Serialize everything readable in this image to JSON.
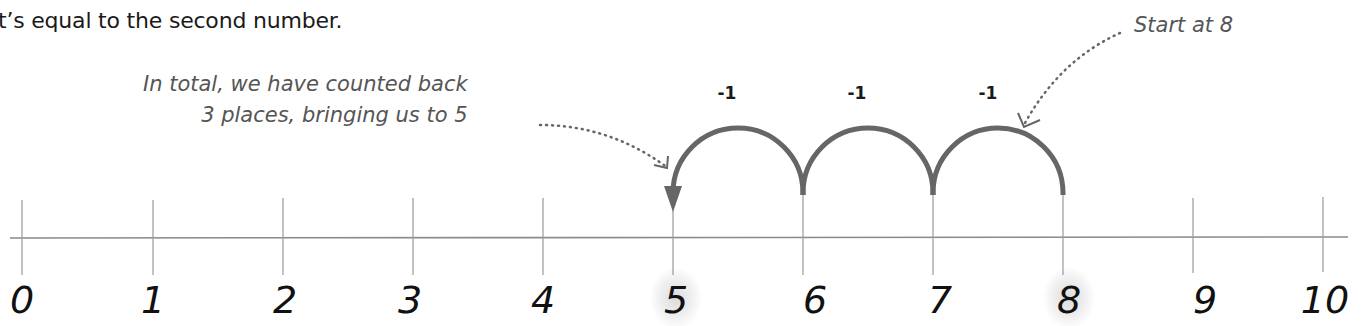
{
  "intro_text": "t’s equal to the second number.",
  "annotations": {
    "total_note_line1": "In total, we have counted back",
    "total_note_line2": "3 places, bringing us to 5",
    "start_note": "Start at 8"
  },
  "jumps": [
    {
      "label": "-1",
      "from": 8,
      "to": 7
    },
    {
      "label": "-1",
      "from": 7,
      "to": 6
    },
    {
      "label": "-1",
      "from": 6,
      "to": 5
    }
  ],
  "number_line": {
    "ticks": [
      "0",
      "1",
      "2",
      "3",
      "4",
      "5",
      "6",
      "7",
      "8",
      "9",
      "10"
    ],
    "highlighted": [
      "5",
      "8"
    ],
    "start": 8,
    "end": 5
  },
  "colors": {
    "arc": "#666666",
    "axis": "#888888",
    "note_text": "#555555",
    "numbers": "#111111"
  }
}
